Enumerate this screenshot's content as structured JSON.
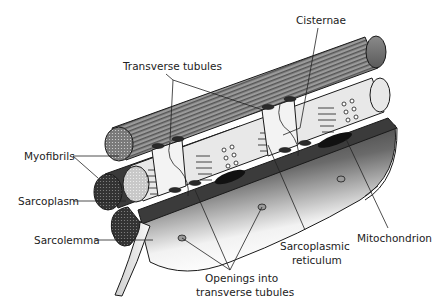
{
  "diagram": {
    "labels": {
      "cisternae": "Cisternae",
      "transverse_tubules": "Transverse tubules",
      "myofibrils": "Myofibrils",
      "sarcoplasm": "Sarcoplasm",
      "sarcolemma": "Sarcolemma",
      "openings_line1": "Openings into",
      "openings_line2": "transverse tubules",
      "sr_line1": "Sarcoplasmic",
      "sr_line2": "reticulum",
      "mitochondrion": "Mitochondrion"
    },
    "colors": {
      "ink": "#1a1a1a",
      "myofibril_striation": "#6b6b6b",
      "sarcoplasm_dark": "#3a3a3a",
      "reticulum_light": "#e6e6e6",
      "membrane_gradient_start": "#1e1e1e",
      "membrane_gradient_end": "#ffffff"
    }
  }
}
